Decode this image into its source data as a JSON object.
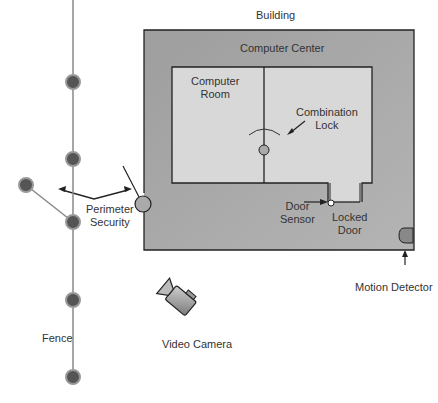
{
  "labels": {
    "building": "Building",
    "computer_center": "Computer Center",
    "computer_room_1": "Computer",
    "computer_room_2": "Room",
    "combination_lock_1": "Combination",
    "combination_lock_2": "Lock",
    "door_sensor_1": "Door",
    "door_sensor_2": "Sensor",
    "locked_door_1": "Locked",
    "locked_door_2": "Door",
    "motion_detector": "Motion Detector",
    "perimeter_security_1": "Perimeter",
    "perimeter_security_2": "Security",
    "fence": "Fence",
    "video_camera": "Video Camera"
  },
  "colors": {
    "building_fill": "#a8a8a8",
    "room_fill": "#d8d8d8",
    "outline": "#222222",
    "fence_post": "#666666",
    "fence_line": "#888888"
  }
}
